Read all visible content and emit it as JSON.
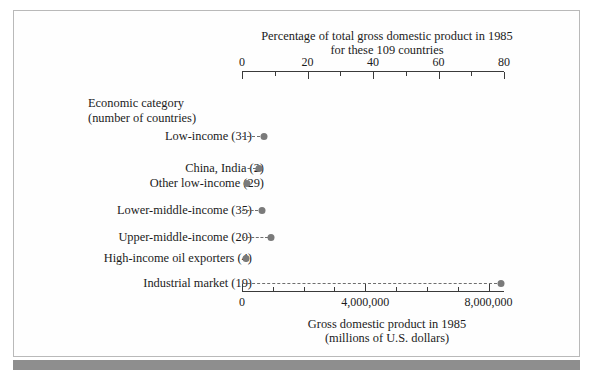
{
  "figure": {
    "top_axis": {
      "title_line1": "Percentage of total gross domestic product in 1985",
      "title_line2": "for these 109 countries",
      "tick_labels": [
        "0",
        "20",
        "40",
        "60",
        "80"
      ]
    },
    "bottom_axis": {
      "title_line1": "Gross domestic product in 1985",
      "title_line2": "(millions of U.S. dollars)",
      "tick_labels": [
        "0",
        "4,000,000",
        "8,000,000"
      ]
    },
    "category_header_line1": "Economic category",
    "category_header_line2": "(number of countries)",
    "rows": [
      {
        "label": "Low-income (31)",
        "percent": 6.7,
        "gdp": 712000,
        "indent": false
      },
      {
        "label": "China, India (2)",
        "percent": 5.2,
        "gdp": 553000,
        "indent": true
      },
      {
        "label": "Other low-income (29)",
        "percent": 1.5,
        "gdp": 159000,
        "indent": true
      },
      {
        "label": "Lower-middle-income (35)",
        "percent": 6.0,
        "gdp": 638000,
        "indent": false
      },
      {
        "label": "Upper-middle-income (20)",
        "percent": 9.0,
        "gdp": 957000,
        "indent": false
      },
      {
        "label": "High-income oil exporters (4)",
        "percent": 1.2,
        "gdp": 128000,
        "indent": false
      },
      {
        "label": "Industrial market (19)",
        "percent": 79.0,
        "gdp": 8400000,
        "indent": false
      }
    ]
  },
  "chart_data": {
    "type": "scatter",
    "title": "Percentage of total gross domestic product in 1985 for these 109 countries",
    "xlabel": "Gross domestic product in 1985 (millions of U.S. dollars)",
    "xlabel_secondary": "Percentage of total gross domestic product in 1985 for these 109 countries",
    "ylabel": "Economic category (number of countries)",
    "categories": [
      "Low-income (31)",
      "China, India (2)",
      "Other low-income (29)",
      "Lower-middle-income (35)",
      "Upper-middle-income (20)",
      "High-income oil exporters (4)",
      "Industrial market (19)"
    ],
    "values_percent": [
      6.7,
      5.2,
      1.5,
      6.0,
      9.0,
      1.2,
      79.0
    ],
    "values_gdp_millions_usd": [
      712000,
      553000,
      159000,
      638000,
      957000,
      128000,
      8400000
    ],
    "xlim_percent": [
      0,
      80
    ],
    "xlim_gdp": [
      0,
      8500000
    ],
    "top_axis_ticks": [
      0,
      20,
      40,
      60,
      80
    ],
    "bottom_axis_ticks": [
      0,
      4000000,
      8000000
    ],
    "grid": false,
    "legend": "none",
    "marker": "filled-circle-with-dashed-leader",
    "marker_color": "#7a7a7a"
  },
  "caption": ""
}
